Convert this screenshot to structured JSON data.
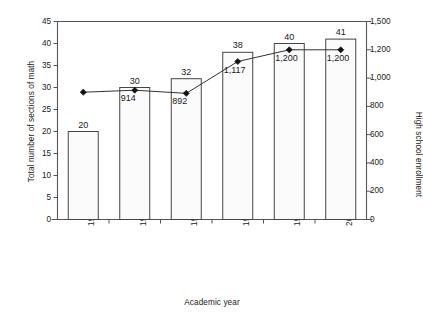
{
  "chart_data": {
    "type": "bar",
    "title": "",
    "xlabel": "Academic year",
    "ylabel": "Total number of sections of math",
    "y2label": "High school enrollment",
    "grid": false,
    "legend": "none",
    "categories": [
      "1990–1991",
      "1992–1993",
      "1994–1995",
      "1996–1997",
      "1998–1999",
      "2000–2001"
    ],
    "ylim": [
      0,
      45
    ],
    "yticks": [
      0,
      5,
      10,
      15,
      20,
      25,
      30,
      35,
      40,
      45
    ],
    "yticklabels": [
      "0",
      "5",
      "10",
      "15",
      "20",
      "25",
      "30",
      "35",
      "40",
      "45"
    ],
    "y2lim": [
      0,
      1500
    ],
    "y2ticks": [
      0,
      200,
      400,
      600,
      800,
      1000,
      1200,
      1500
    ],
    "y2ticklabels": [
      "0",
      "200",
      "400",
      "600",
      "800",
      "1,000",
      "1,200",
      "1,500"
    ],
    "series": [
      {
        "name": "Total number of sections of math",
        "type": "bar",
        "axis": "left",
        "values": [
          20,
          30,
          32,
          38,
          40,
          41
        ],
        "labels": [
          "20",
          "30",
          "32",
          "38",
          "40",
          "41"
        ]
      },
      {
        "name": "High school enrollment",
        "type": "line",
        "axis": "right",
        "values": [
          900,
          914,
          892,
          1117,
          1200,
          1200
        ],
        "labels": [
          "",
          "914",
          "892",
          "1,117",
          "1,200",
          "1,200"
        ]
      }
    ],
    "colors": {
      "bar_fill": "#fbfbfb",
      "bar_edge": "#444444",
      "line": "#333333",
      "marker": "#111111",
      "axis": "#555555",
      "text": "#1a1a1a"
    }
  }
}
